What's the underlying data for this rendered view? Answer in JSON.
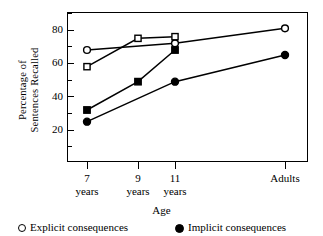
{
  "chart_data": {
    "type": "line",
    "title": "",
    "xlabel": "Age",
    "ylabel": "Percentage of Sentences Recalled",
    "categories": [
      "7 years",
      "9 years",
      "11 years",
      "Adults"
    ],
    "category_lines": [
      [
        "7",
        "years"
      ],
      [
        "9",
        "years"
      ],
      [
        "11",
        "years"
      ],
      [
        "Adults",
        ""
      ]
    ],
    "ylim": [
      0,
      90
    ],
    "yticks_major": [
      20,
      40,
      60,
      80
    ],
    "yticks_minor": [
      10,
      30,
      50,
      70,
      90
    ],
    "ytick_labels": [
      "20",
      "40",
      "60",
      "80"
    ],
    "grid": false,
    "legend_position": "below",
    "series": [
      {
        "name": "Explicit consequences",
        "marker": "open-circle",
        "x": [
          "7 years",
          "11 years",
          "Adults"
        ],
        "values": [
          68,
          72,
          81
        ]
      },
      {
        "name": "Explicit consequences",
        "marker": "open-square",
        "x": [
          "7 years",
          "9 years",
          "11 years"
        ],
        "values": [
          58,
          75,
          76
        ]
      },
      {
        "name": "Implicit consequences",
        "marker": "filled-square",
        "x": [
          "7 years",
          "9 years",
          "11 years"
        ],
        "values": [
          32,
          49,
          68
        ]
      },
      {
        "name": "Implicit consequences",
        "marker": "filled-circle",
        "x": [
          "7 years",
          "11 years",
          "Adults"
        ],
        "values": [
          25,
          49,
          65
        ]
      }
    ]
  },
  "axes": {
    "ylabel_line1": "Percentage of",
    "ylabel_line2": "Sentences Recalled",
    "xlabel": "Age"
  },
  "legend": {
    "items": [
      {
        "marker": "open-circle",
        "label": "Explicit consequences"
      },
      {
        "marker": "filled-circle",
        "label": "Implicit consequences"
      }
    ]
  },
  "colors": {
    "ink": "#000000",
    "background": "#ffffff",
    "marker_fill_open": "#ffffff",
    "marker_fill_solid": "#000000"
  }
}
